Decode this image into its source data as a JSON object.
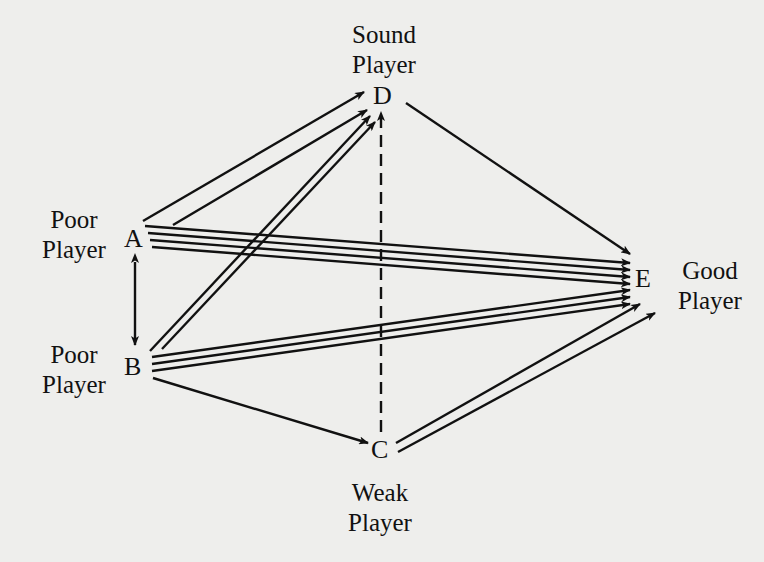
{
  "diagram": {
    "type": "directed-graph",
    "nodes": {
      "A": {
        "letter": "A",
        "label_line1": "Poor",
        "label_line2": "Player"
      },
      "B": {
        "letter": "B",
        "label_line1": "Poor",
        "label_line2": "Player"
      },
      "C": {
        "letter": "C",
        "label_line1": "Weak",
        "label_line2": "Player"
      },
      "D": {
        "letter": "D",
        "label_line1": "Sound",
        "label_line2": "Player"
      },
      "E": {
        "letter": "E",
        "label_line1": "Good",
        "label_line2": "Player"
      }
    },
    "edges": [
      {
        "from": "A",
        "to": "D",
        "count": 2,
        "style": "solid"
      },
      {
        "from": "A",
        "to": "E",
        "count": 4,
        "style": "solid"
      },
      {
        "from": "A",
        "to": "B",
        "count": 1,
        "style": "solid",
        "bidirectional": true
      },
      {
        "from": "B",
        "to": "D",
        "count": 2,
        "style": "solid"
      },
      {
        "from": "B",
        "to": "E",
        "count": 3,
        "style": "solid"
      },
      {
        "from": "B",
        "to": "C",
        "count": 1,
        "style": "solid"
      },
      {
        "from": "C",
        "to": "D",
        "count": 1,
        "style": "dashed"
      },
      {
        "from": "C",
        "to": "E",
        "count": 2,
        "style": "solid"
      },
      {
        "from": "D",
        "to": "E",
        "count": 1,
        "style": "solid"
      }
    ],
    "colors": {
      "ink": "#111111",
      "paper": "#eeeeec"
    }
  }
}
